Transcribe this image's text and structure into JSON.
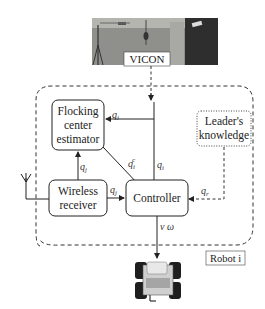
{
  "diagram": {
    "vicon": {
      "label": "VICON",
      "photo": "motion-capture-cameras-photo"
    },
    "robot_boundary_label": "Robot i",
    "blocks": {
      "flocking_estimator": [
        "Flocking",
        "center",
        "estimator"
      ],
      "leaders_knowledge": [
        "Leader's",
        "knowledge"
      ],
      "wireless_receiver": [
        "Wireless",
        "receiver"
      ],
      "controller": [
        "Controller"
      ]
    },
    "signals": {
      "qi_to_estimator": {
        "base": "q",
        "sub": "i"
      },
      "qi_to_controller": {
        "base": "q",
        "sub": "i"
      },
      "qj_to_estimator": {
        "base": "q",
        "sub": "j"
      },
      "qj_to_controller": {
        "base": "q",
        "sub": "j"
      },
      "qic": {
        "base": "q",
        "sub": "i",
        "sup": "c"
      },
      "qr": {
        "base": "q",
        "sub": "r"
      },
      "output": "v  ω"
    },
    "robot_image": "four-wheeled-robot",
    "colors": {
      "line": "#222222",
      "dashed": "#333333",
      "photo_bg": "#8a8a86",
      "photo_dark": "#2a2a2a"
    }
  }
}
